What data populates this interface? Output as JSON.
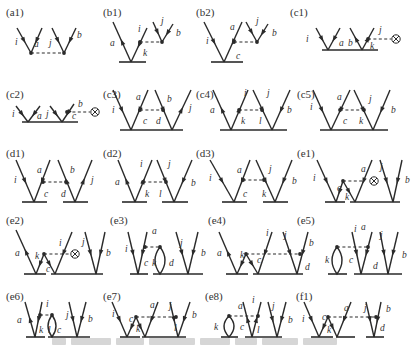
{
  "figure": {
    "type": "Feynman / Goldstone diagrams",
    "panels": [
      {
        "id": "a1",
        "label": "(a1)",
        "indices": [
          "i",
          "a",
          "j",
          "b"
        ]
      },
      {
        "id": "b1",
        "label": "(b1)",
        "indices": [
          "a",
          "i",
          "k",
          "j",
          "b"
        ]
      },
      {
        "id": "b2",
        "label": "(b2)",
        "indices": [
          "i",
          "a",
          "c",
          "j",
          "b"
        ]
      },
      {
        "id": "c1",
        "label": "(c1)",
        "indices": [
          "i",
          "a",
          "b",
          "j",
          "k"
        ],
        "operator": "⊗"
      },
      {
        "id": "c2",
        "label": "(c2)",
        "indices": [
          "i",
          "a",
          "j",
          "b",
          "c"
        ],
        "operator": "⊗"
      },
      {
        "id": "c3",
        "label": "(c3)",
        "indices": [
          "i",
          "a",
          "c",
          "b",
          "d",
          "j"
        ]
      },
      {
        "id": "c4",
        "label": "(c4)",
        "indices": [
          "a",
          "i",
          "k",
          "j",
          "l",
          "b"
        ]
      },
      {
        "id": "c5",
        "label": "(c5)",
        "indices": [
          "i",
          "a",
          "c",
          "j",
          "k",
          "b"
        ]
      },
      {
        "id": "d1",
        "label": "(d1)",
        "indices": [
          "i",
          "a",
          "c",
          "b",
          "d",
          "j"
        ]
      },
      {
        "id": "d2",
        "label": "(d2)",
        "indices": [
          "a",
          "i",
          "k",
          "j",
          "l",
          "b"
        ]
      },
      {
        "id": "d3",
        "label": "(d3)",
        "indices": [
          "i",
          "a",
          "c",
          "j",
          "k",
          "b"
        ]
      },
      {
        "id": "e1",
        "label": "(e1)",
        "indices": [
          "i",
          "c",
          "k",
          "a",
          "j",
          "b"
        ],
        "operator": "⊗"
      },
      {
        "id": "e2",
        "label": "(e2)",
        "indices": [
          "a",
          "k",
          "c",
          "i",
          "j",
          "b"
        ],
        "operator": "⊗"
      },
      {
        "id": "e3",
        "label": "(e3)",
        "indices": [
          "i",
          "a",
          "c",
          "k",
          "d",
          "j",
          "b"
        ]
      },
      {
        "id": "e4",
        "label": "(e4)",
        "indices": [
          "a",
          "k",
          "c",
          "i",
          "j",
          "b",
          "d"
        ]
      },
      {
        "id": "e5",
        "label": "(e5)",
        "indices": [
          "k",
          "c",
          "d",
          "i",
          "a",
          "j",
          "b"
        ]
      },
      {
        "id": "e6",
        "label": "(e6)",
        "indices": [
          "a",
          "i",
          "k",
          "l",
          "c",
          "j",
          "b"
        ]
      },
      {
        "id": "e7",
        "label": "(e7)",
        "indices": [
          "i",
          "c",
          "k",
          "a",
          "j",
          "l",
          "b"
        ]
      },
      {
        "id": "e8",
        "label": "(e8)",
        "indices": [
          "k",
          "c",
          "a",
          "i",
          "l",
          "j",
          "b"
        ]
      },
      {
        "id": "f1",
        "label": "(f1)",
        "indices": [
          "i",
          "c",
          "k",
          "a",
          "j",
          "b",
          "d"
        ]
      }
    ]
  },
  "caption": ""
}
